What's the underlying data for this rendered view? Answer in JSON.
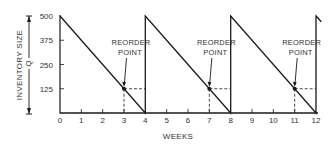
{
  "chart_data": {
    "type": "line",
    "title": "",
    "xlabel": "WEEKS",
    "ylabel": "INVENTORY SIZE",
    "dimension_label": "Q",
    "x_ticks": [
      0,
      1,
      2,
      3,
      4,
      5,
      6,
      7,
      8,
      9,
      10,
      11,
      12
    ],
    "y_ticks": [
      125,
      250,
      375,
      500
    ],
    "xlim": [
      0,
      12
    ],
    "ylim": [
      0,
      500
    ],
    "grid": false,
    "legend": null,
    "series": [
      {
        "name": "Inventory level",
        "points": [
          {
            "x": 0,
            "y": 500
          },
          {
            "x": 4,
            "y": 0
          },
          {
            "x": 4,
            "y": 500
          },
          {
            "x": 8,
            "y": 0
          },
          {
            "x": 8,
            "y": 500
          },
          {
            "x": 12,
            "y": 0
          },
          {
            "x": 12,
            "y": 500
          },
          {
            "x": 12.25,
            "y": 470
          }
        ]
      }
    ],
    "annotations": [
      {
        "label_line1": "REORDER",
        "label_line2": "POINT",
        "x": 3,
        "y": 125
      },
      {
        "label_line1": "REORDER",
        "label_line2": "POINT",
        "x": 7,
        "y": 125
      },
      {
        "label_line1": "REORDER",
        "label_line2": "POINT",
        "x": 11,
        "y": 125
      }
    ],
    "reorder_level": 125,
    "order_quantity": 500,
    "cycle_length_weeks": 4,
    "colors": {
      "line": "#1a1a1a",
      "text": "#333333",
      "dashed": "#333333"
    }
  }
}
